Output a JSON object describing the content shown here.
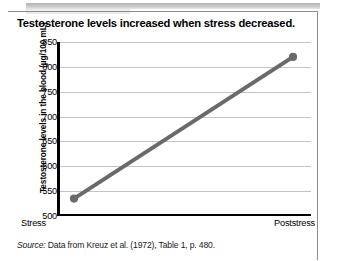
{
  "figure": {
    "title": "Testosterone levels increased when stress decreased.",
    "source_label": "Source:",
    "source_text": " Data from Kreuz et al. (1972), Table 1, p. 480."
  },
  "chart_data": {
    "type": "line",
    "title": "Testosterone levels increased when stress decreased.",
    "xlabel": "",
    "ylabel": "Testosterone levels in the blood (µg/100 mL)",
    "categories": [
      "Stress",
      "Poststress"
    ],
    "values": [
      535,
      820
    ],
    "series": [
      {
        "name": "Testosterone level",
        "values": [
          535,
          820
        ],
        "color": "#6a6a6a"
      }
    ],
    "ylim": [
      500,
      850
    ],
    "yticks": [
      500,
      550,
      600,
      650,
      700,
      750,
      800,
      850
    ],
    "ytick_labels": [
      "500",
      "550",
      "600",
      "650",
      "700",
      "750",
      "800",
      "850"
    ],
    "grid": true,
    "legend": "none",
    "marker": "circle",
    "line_width_px": 4
  },
  "colors": {
    "line": "#6a6a6a",
    "marker": "#6a6a6a",
    "gridline": "#c3c3c3",
    "axis": "#000000",
    "frame": "#8d8d8d",
    "title_text": "#000000"
  }
}
